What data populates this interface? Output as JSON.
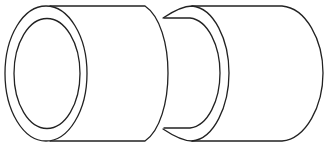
{
  "figure": {
    "stroke_color": "#222222",
    "background": "#ffffff",
    "parts": [
      {
        "name": "large-cylinder",
        "label": "Large sleeve"
      },
      {
        "name": "small-cylinder",
        "label": "Reduced sleeve"
      }
    ]
  }
}
